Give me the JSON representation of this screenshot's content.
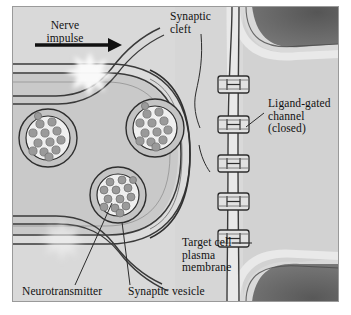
{
  "figure": {
    "canvas": {
      "width": 351,
      "height": 315
    },
    "colors": {
      "page_background": "#ffffff",
      "extracellular_fluid": "#d9d9d9",
      "presynaptic_cytoplasm": "#c9c9c9",
      "target_cell_cytoplasm": "#d2d2d2",
      "membrane_line": "#3a3a3a",
      "membrane_fill": "#e8e8e8",
      "dark_region": "#555555",
      "vesicle_interior": "#efefef",
      "neurotransmitter_dot": "#9a9a9a",
      "burst_white": "#f7f7f7",
      "text": "#111111",
      "leader_line": "#2b2b2b"
    }
  },
  "labels": {
    "nerve_impulse": "Nerve\nimpulse",
    "synaptic_cleft": "Synaptic\ncleft",
    "ligand_gated_channel": "Ligand-gated\nchannel\n(closed)",
    "target_cell_membrane": "Target cell\nplasma\nmembrane",
    "neurotransmitter": "Neurotransmitter",
    "synaptic_vesicle": "Synaptic vesicle"
  },
  "structures": {
    "vesicles": [
      {
        "id": "vesicle-upper-left",
        "cx": 48,
        "cy": 138,
        "r_outer": 29,
        "r_inner": 22,
        "dots": 13
      },
      {
        "id": "vesicle-upper-right",
        "cx": 155,
        "cy": 128,
        "r_outer": 29,
        "r_inner": 22,
        "dots": 13
      },
      {
        "id": "vesicle-lower-center",
        "cx": 118,
        "cy": 195,
        "r_outer": 28,
        "r_inner": 21,
        "dots": 13
      }
    ],
    "channels": [
      {
        "id": "channel-1",
        "cy": 84
      },
      {
        "id": "channel-2",
        "cy": 124
      },
      {
        "id": "channel-3",
        "cy": 163
      },
      {
        "id": "channel-4",
        "cy": 201
      },
      {
        "id": "channel-5",
        "cy": 238
      }
    ],
    "channel_count": 5,
    "bursts": [
      {
        "id": "burst-upper",
        "cx": 90,
        "cy": 72,
        "r": 18,
        "opacity": 1.0
      },
      {
        "id": "burst-lower",
        "cx": 62,
        "cy": 237,
        "r": 16,
        "opacity": 0.55
      }
    ],
    "impulse_arrow": {
      "x1": 35,
      "y1": 45,
      "x2": 116,
      "y2": 45,
      "direction": "right"
    }
  }
}
